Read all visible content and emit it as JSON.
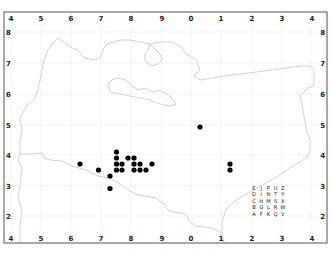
{
  "map": {
    "x_ticks": [
      {
        "label": "4",
        "x": 11
      },
      {
        "label": "5",
        "x": 41
      },
      {
        "label": "6",
        "x": 71
      },
      {
        "label": "7",
        "x": 101
      },
      {
        "label": "8",
        "x": 131
      },
      {
        "label": "9",
        "x": 162
      },
      {
        "label": "0",
        "x": 191
      },
      {
        "label": "1",
        "x": 221
      },
      {
        "label": "2",
        "x": 252
      },
      {
        "label": "3",
        "x": 282
      },
      {
        "label": "4",
        "x": 312
      }
    ],
    "y_ticks": [
      {
        "label": "8",
        "y": 32
      },
      {
        "label": "7",
        "y": 63
      },
      {
        "label": "6",
        "y": 94
      },
      {
        "label": "5",
        "y": 125
      },
      {
        "label": "4",
        "y": 155
      },
      {
        "label": "3",
        "y": 186
      },
      {
        "label": "2",
        "y": 216
      }
    ],
    "dots": [
      {
        "x": 80,
        "y": 164
      },
      {
        "x": 98.5,
        "y": 170
      },
      {
        "x": 110,
        "y": 176
      },
      {
        "x": 110,
        "y": 188.5
      },
      {
        "x": 116.5,
        "y": 152
      },
      {
        "x": 116.5,
        "y": 158
      },
      {
        "x": 116.5,
        "y": 164
      },
      {
        "x": 116.5,
        "y": 170
      },
      {
        "x": 122,
        "y": 164
      },
      {
        "x": 122,
        "y": 170
      },
      {
        "x": 128,
        "y": 158
      },
      {
        "x": 134,
        "y": 158
      },
      {
        "x": 134,
        "y": 164
      },
      {
        "x": 134,
        "y": 170
      },
      {
        "x": 140,
        "y": 164
      },
      {
        "x": 140,
        "y": 170
      },
      {
        "x": 146,
        "y": 170
      },
      {
        "x": 152,
        "y": 164
      },
      {
        "x": 200,
        "y": 127
      },
      {
        "x": 230,
        "y": 164
      },
      {
        "x": 230,
        "y": 170
      }
    ],
    "legend_grid": [
      [
        "E",
        "J",
        "P",
        "U",
        "Z"
      ],
      [
        "D",
        "I",
        "N",
        "T",
        "Y"
      ],
      [
        "C",
        "H",
        "M",
        "S",
        "X"
      ],
      [
        "B",
        "G",
        "L",
        "R",
        "W"
      ],
      [
        "A",
        "F",
        "K",
        "Q",
        "V"
      ]
    ],
    "colors": {
      "dot": "#000000",
      "outline": "#c8c8c8",
      "frame": "#555555",
      "grid": "#ececec"
    }
  }
}
